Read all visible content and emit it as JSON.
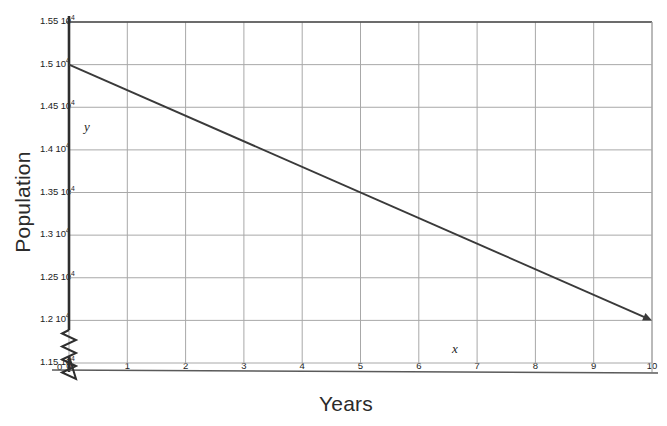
{
  "chart_data": {
    "type": "line",
    "title": "",
    "xlabel": "Years",
    "ylabel": "Population",
    "x": [
      0,
      10
    ],
    "values": [
      15000,
      12000
    ],
    "series": [
      {
        "name": "Population",
        "x": [
          0,
          10
        ],
        "values": [
          15000,
          12000
        ]
      }
    ],
    "xlim": [
      0,
      10
    ],
    "ylim": [
      11500,
      15500
    ],
    "grid": true,
    "legend": false,
    "y_axis_broken": true,
    "line_has_arrowhead": true,
    "x_tick_labels": [
      "0",
      "1",
      "2",
      "3",
      "4",
      "5",
      "6",
      "7",
      "8",
      "9",
      "10"
    ],
    "x_tick_values": [
      0,
      1,
      2,
      3,
      4,
      5,
      6,
      7,
      8,
      9,
      10
    ],
    "y_tick_values": [
      11500,
      12000,
      12500,
      13000,
      13500,
      14000,
      14500,
      15000,
      15500
    ],
    "y_tick_labels": [
      {
        "mantissa": "1.15 10",
        "exponent": "4"
      },
      {
        "mantissa": "1.2 10",
        "exponent": "4"
      },
      {
        "mantissa": "1.25 10",
        "exponent": "4"
      },
      {
        "mantissa": "1.3 10",
        "exponent": "4"
      },
      {
        "mantissa": "1.35 10",
        "exponent": "4"
      },
      {
        "mantissa": "1.4 10",
        "exponent": "4"
      },
      {
        "mantissa": "1.45 10",
        "exponent": "4"
      },
      {
        "mantissa": "1.5 10",
        "exponent": "4"
      },
      {
        "mantissa": "1.55 10",
        "exponent": "4"
      }
    ],
    "annotations": {
      "y_axis_variable": "y",
      "x_axis_variable": "x",
      "origin_label": "0"
    },
    "colors": {
      "line": "#3a3a3a",
      "grid": "#a8a8a8",
      "frame": "#4a4a4a",
      "text": "#231f20",
      "background": "#ffffff"
    }
  }
}
